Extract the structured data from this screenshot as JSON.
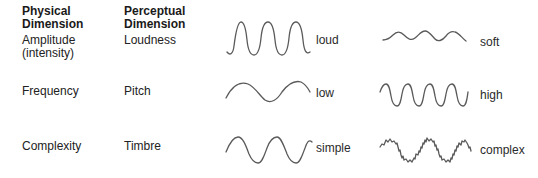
{
  "headers": {
    "physical": "Physical\nDimension",
    "perceptual": "Perceptual\nDimension"
  },
  "rows": [
    {
      "physical": "Amplitude\n(intensity)",
      "perceptual": "Loudness",
      "wave_a": {
        "label": "loud",
        "icon": "high-amplitude-sine-wave"
      },
      "wave_b": {
        "label": "soft",
        "icon": "low-amplitude-sine-wave"
      }
    },
    {
      "physical": "Frequency",
      "perceptual": "Pitch",
      "wave_a": {
        "label": "low",
        "icon": "low-frequency-sine-wave"
      },
      "wave_b": {
        "label": "high",
        "icon": "high-frequency-sine-wave"
      }
    },
    {
      "physical": "Complexity",
      "perceptual": "Timbre",
      "wave_a": {
        "label": "simple",
        "icon": "pure-sine-wave"
      },
      "wave_b": {
        "label": "complex",
        "icon": "complex-noisy-wave"
      }
    }
  ],
  "colors": {
    "wave_stroke": "#5a5a5a",
    "text": "#222222"
  }
}
